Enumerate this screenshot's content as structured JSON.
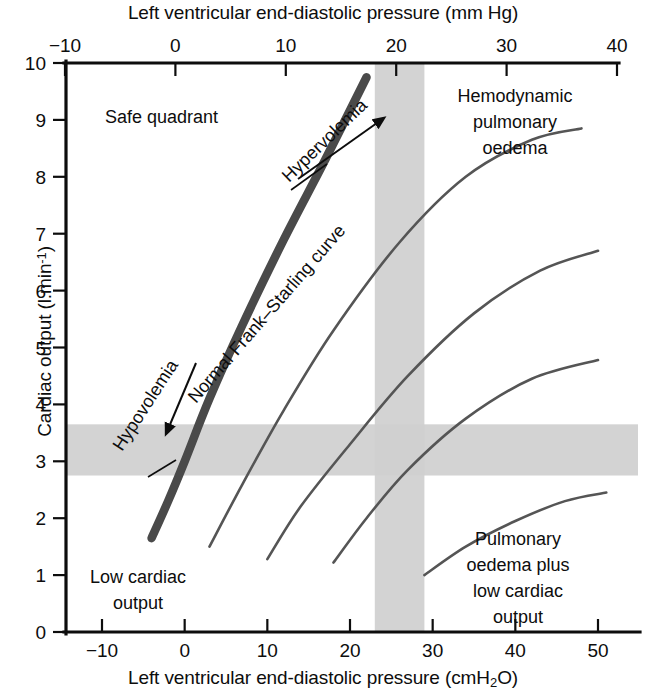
{
  "chart_data": {
    "type": "line",
    "title": "",
    "top_axis": {
      "label": "Left ventricular end-diastolic pressure (mm Hg)",
      "ticks": [
        "-10",
        "0",
        "10",
        "20",
        "30",
        "40"
      ],
      "range": [
        -10,
        40
      ]
    },
    "bottom_axis": {
      "label": "Left ventricular end-diastolic pressure (cmH2O)",
      "label_main": "Left ventricular end-diastolic pressure (cmH",
      "label_sub": "2",
      "label_tail": "O)",
      "ticks": [
        "-10",
        "0",
        "10",
        "20",
        "30",
        "40",
        "50"
      ],
      "range": [
        -10,
        50
      ]
    },
    "y_axis": {
      "label": "Cardiac output (l.min-1)",
      "label_main": "Cardiac output (l.min",
      "label_sup": "-1",
      "label_tail": ")",
      "ticks": [
        "0",
        "1",
        "2",
        "3",
        "4",
        "5",
        "6",
        "7",
        "8",
        "9",
        "10"
      ],
      "range": [
        0,
        10
      ]
    },
    "bands": {
      "horizontal": {
        "y_from": 2.75,
        "y_to": 3.65,
        "color": "#cfcfcf"
      },
      "vertical": {
        "x_from": 23,
        "x_to": 29,
        "color": "#cfcfcf"
      }
    },
    "series": [
      {
        "name": "Normal Frank-Starling curve",
        "emphasis": "thick",
        "points": [
          [
            -4,
            1.65
          ],
          [
            -2,
            2.3
          ],
          [
            0,
            3.0
          ],
          [
            3,
            4.1
          ],
          [
            7,
            5.4
          ],
          [
            12,
            6.9
          ],
          [
            17,
            8.3
          ],
          [
            22,
            9.75
          ]
        ]
      },
      {
        "name": "depressed curve 1",
        "emphasis": "thin",
        "points": [
          [
            3,
            1.5
          ],
          [
            7,
            2.6
          ],
          [
            12,
            3.9
          ],
          [
            18,
            5.3
          ],
          [
            26,
            6.85
          ],
          [
            34,
            8.0
          ],
          [
            42,
            8.65
          ],
          [
            48,
            8.85
          ]
        ]
      },
      {
        "name": "depressed curve 2",
        "emphasis": "thin",
        "points": [
          [
            10,
            1.28
          ],
          [
            14,
            2.2
          ],
          [
            20,
            3.3
          ],
          [
            27,
            4.5
          ],
          [
            35,
            5.6
          ],
          [
            43,
            6.35
          ],
          [
            50,
            6.7
          ]
        ]
      },
      {
        "name": "depressed curve 3",
        "emphasis": "thin",
        "points": [
          [
            18,
            1.22
          ],
          [
            22,
            2.0
          ],
          [
            27,
            2.85
          ],
          [
            34,
            3.75
          ],
          [
            42,
            4.45
          ],
          [
            50,
            4.78
          ]
        ]
      },
      {
        "name": "severely depressed curve 4",
        "emphasis": "thin",
        "points": [
          [
            29,
            1.0
          ],
          [
            34,
            1.5
          ],
          [
            40,
            1.95
          ],
          [
            46,
            2.3
          ],
          [
            51,
            2.45
          ]
        ]
      }
    ],
    "annotations": [
      {
        "id": "safe-quadrant",
        "text": "Safe quadrant",
        "x": 105,
        "y": 123
      },
      {
        "id": "hemodynamic-pulmonary-oedema",
        "lines": [
          "Hemodynamic",
          "pulmonary",
          "oedema"
        ],
        "x": 515,
        "y": 102
      },
      {
        "id": "pulmonary-oedema-plus-low-cardiac-output",
        "lines": [
          "Pulmonary",
          "oedema plus",
          "low cardiac",
          "output"
        ],
        "x": 518,
        "y": 545
      },
      {
        "id": "low-cardiac-output",
        "lines": [
          "Low cardiac",
          "output"
        ],
        "x": 138,
        "y": 583
      },
      {
        "id": "hypervolemia",
        "text": "Hypervolemia",
        "rotation": -42
      },
      {
        "id": "hypovolemia",
        "text": "Hypovolemia",
        "rotation": -57
      },
      {
        "id": "normal-frank-starling-curve",
        "text": "Normal Frank–Starling curve",
        "rotation": -49
      }
    ]
  },
  "colors": {
    "band": "#cfcfcf",
    "curve": "#555555",
    "curve_main": "#4a4a4a",
    "axis": "#0d0d0d",
    "background": "#ffffff"
  }
}
